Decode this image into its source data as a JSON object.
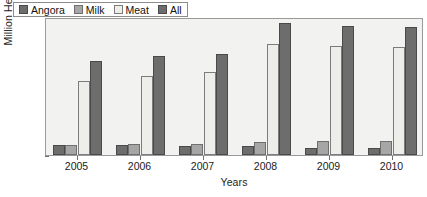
{
  "chart_data": {
    "type": "bar",
    "title": "",
    "xlabel": "Years",
    "ylabel": "Million Head",
    "categories": [
      "2005",
      "2006",
      "2007",
      "2008",
      "2009",
      "2010"
    ],
    "ylim": [
      0,
      4.0
    ],
    "yticks": [
      "0",
      "0.5",
      "1.0",
      "1.5",
      "2.0",
      "2.5",
      "3.0",
      "3.5",
      "4.0"
    ],
    "ytick_values": [
      0,
      0.5,
      1.0,
      1.5,
      2.0,
      2.5,
      3.0,
      3.5,
      4.0
    ],
    "grid": false,
    "legend_position": "top-left",
    "series": [
      {
        "name": "Angora",
        "color": "#6d6d6d",
        "values": [
          0.3,
          0.28,
          0.26,
          0.25,
          0.2,
          0.2
        ]
      },
      {
        "name": "Milk",
        "color": "#a6a6a6",
        "values": [
          0.3,
          0.32,
          0.33,
          0.38,
          0.41,
          0.42
        ]
      },
      {
        "name": "Meat",
        "color": "#ededea",
        "values": [
          2.15,
          2.29,
          2.4,
          3.22,
          3.17,
          3.13
        ]
      },
      {
        "name": "All",
        "color": "#6d6d6d",
        "values": [
          2.72,
          2.86,
          2.94,
          3.83,
          3.74,
          3.71
        ]
      }
    ]
  }
}
